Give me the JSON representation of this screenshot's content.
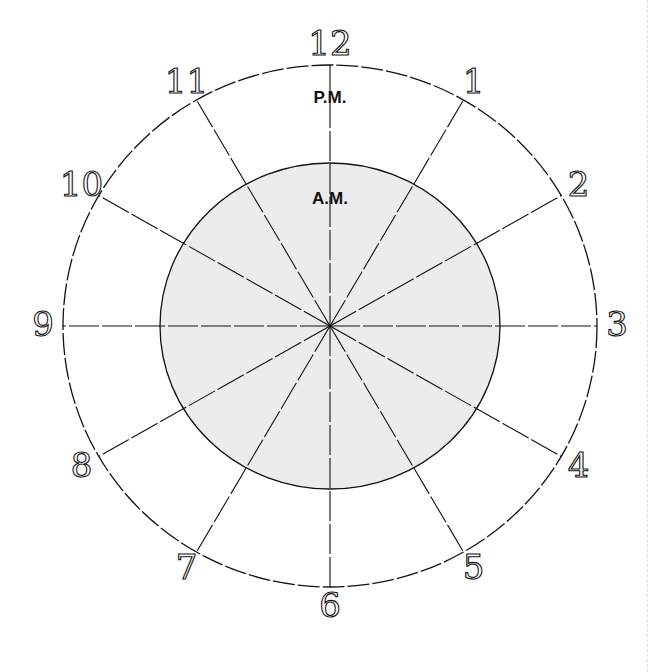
{
  "diagram": {
    "center": {
      "x": 330,
      "y": 326
    },
    "outer_radius": {
      "rx": 267,
      "ry": 261
    },
    "inner_radius": {
      "rx": 170,
      "ry": 163
    },
    "inner_fill": "#ececec",
    "stroke": "#111111",
    "pm_label": "P.M.",
    "am_label": "A.M.",
    "hours": [
      "12",
      "1",
      "2",
      "3",
      "4",
      "5",
      "6",
      "7",
      "8",
      "9",
      "10",
      "11"
    ]
  }
}
